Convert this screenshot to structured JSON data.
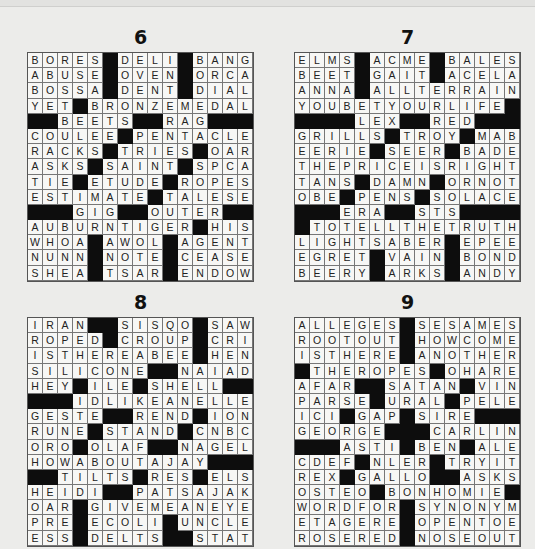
{
  "page": {
    "type": "crossword-solutions"
  },
  "puzzles": [
    {
      "number": "6",
      "rows": [
        "BORES#DELI#BANG",
        "ABUSE#OVEN#ORCA",
        "BOSSA#DENT#DIAL",
        "YET#BRONZEMEDAL",
        "##BEETS##RAG###",
        "COULEE#PENTACLE",
        "RACKS#TRIES#OAR",
        "ASKS#SAINT#SPCA",
        "TIE#ETUDE#ROPES",
        "ESTIMATE#TALESE",
        "###GIG##OUTER##",
        "AUBURNTIGER#HIS",
        "WHOA#AWOL#AGENT",
        "NUNN#NOTE#CEASE",
        "SHEA#TSAR#ENDOW"
      ]
    },
    {
      "number": "7",
      "rows": [
        "ELMS#ACME#BALES",
        "BEET#GAIT#ACELA",
        "ANNA#ALLTERRAIN",
        "YOUBETYOURLIFE#",
        "####LEX##RED###",
        "GRILLS#TROY#MAB",
        "EERIE#SEER#BADE",
        "THEPRICEISRIGHT",
        "TANS#DAMN#ORNOT",
        "OBE#PENS#SOLACE",
        "###ERA##STS####",
        "#TOTELLTHETRUTH",
        "LIGHTSABER#EPEE",
        "EGRET#VAIN#BOND",
        "BEERY#ARKS#ANDY"
      ]
    },
    {
      "number": "8",
      "rows": [
        "IRAN##SISQO#SAW",
        "ROPED#CROUP#CRI",
        "ISTHEREABEE#HEN",
        "SILICONE##NAIAD",
        "HEY#ILE#SHELL##",
        "###IDLIKEANELLE",
        "GESTE##REND#ION",
        "RUNE#STAND#CNBC",
        "ORO#OLAF##NAGEL",
        "HOWABOUTAJAY###",
        "##TILTS#RES#ELS",
        "HEIDI##PATSAJAK",
        "OAR#GIVEMEANEYE",
        "PRE#ECOLI#UNCLE",
        "ESS#DELTS##STAT"
      ]
    },
    {
      "number": "9",
      "rows": [
        "ALLEGES#SESAMES",
        "ROOTOUT#HOWCOME",
        "ISTHERE#ANOTHER",
        "#THEROPES#OHARE",
        "AFAR##SATAN#VIN",
        "PARSE#URAL#PELE",
        "ICI#GAP#SIRE###",
        "GEORGE###CARLIN",
        "###ASTI#BEN#ALE",
        "CDEF#NLER#TRYIT",
        "REX#GALLO##ASKS",
        "OSTEO#BONHOMIE#",
        "WORDFOR#SYNONYM",
        "ETAGERE#OPENTOE",
        "ROSERED#NOSEOUT"
      ]
    }
  ],
  "colors": {
    "background": "#ececea",
    "cell": "#f7f7f5",
    "block": "#0d0d0d",
    "text": "#222222"
  }
}
